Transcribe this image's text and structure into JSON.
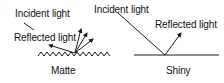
{
  "diagram": {
    "colors": {
      "line": "#1a1a1a",
      "text": "#111111",
      "background": "#ffffff"
    },
    "panels": [
      {
        "id": "matte",
        "surface_label": "Matte",
        "incident_label": "Incident light",
        "reflected_label": "Reflected light",
        "surface_type": "zigzag",
        "reflected_arrow_count": 4
      },
      {
        "id": "shiny",
        "surface_label": "Shiny",
        "incident_label": "Incident light",
        "reflected_label": "Reflected light",
        "surface_type": "flat",
        "reflected_arrow_count": 1
      }
    ]
  }
}
